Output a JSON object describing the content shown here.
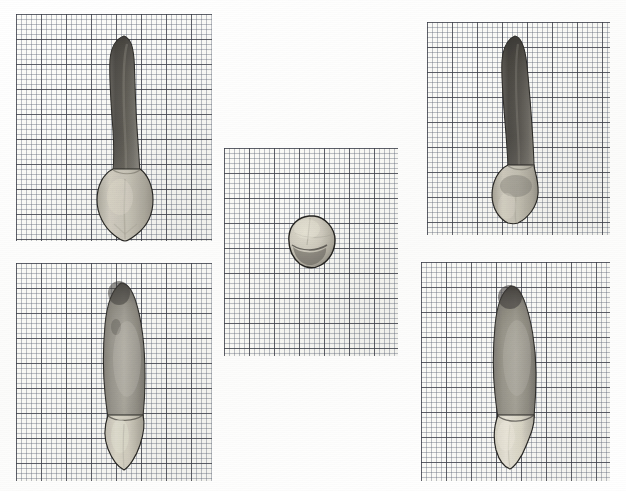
{
  "plate": {
    "title": "Tooth specimen photographic plate",
    "description": "Five photographic views of an extracted human maxillary canine tooth, each placed on millimetre graph paper",
    "background_color": "#ffffff",
    "width": 626,
    "height": 491
  },
  "grid": {
    "paper_color": "#fdfdfb",
    "fine_line_color": "#60687a",
    "bold_line_color": "#3c3e48",
    "fine_spacing_px": 5,
    "bold_spacing_px": 25,
    "units": "mm"
  },
  "palette": {
    "root_dark": "#4c4a46",
    "root_mid": "#6f6c66",
    "root_light": "#8d8a83",
    "crown_enamel": "#cdc9bd",
    "crown_highlight": "#e2ded2",
    "crown_shadow": "#a9a59a",
    "outline": "#2b2a27",
    "cej_line": "#55524c"
  },
  "panels": [
    {
      "id": "panel-top-left",
      "view_label": "labial",
      "position": {
        "x": 16,
        "y": 14,
        "width": 196,
        "height": 227
      },
      "specimen": {
        "id": "specimen-top-left",
        "name": "maxillary-canine-labial-view",
        "orientation": "root-up",
        "root_shade": "dark",
        "crown_shade": "light",
        "box": {
          "x": 78,
          "y": 20,
          "width": 64,
          "height": 208
        }
      }
    },
    {
      "id": "panel-bottom-left",
      "view_label": "mesial",
      "position": {
        "x": 16,
        "y": 263,
        "width": 196,
        "height": 218
      },
      "specimen": {
        "id": "specimen-bottom-left",
        "name": "maxillary-canine-mesial-view",
        "orientation": "root-up",
        "root_shade": "medium",
        "crown_shade": "light",
        "box": {
          "x": 78,
          "y": 18,
          "width": 66,
          "height": 190
        }
      }
    },
    {
      "id": "panel-center",
      "view_label": "incisal",
      "position": {
        "x": 224,
        "y": 148,
        "width": 174,
        "height": 208
      },
      "specimen": {
        "id": "specimen-center",
        "name": "maxillary-canine-incisal-view",
        "orientation": "occlusal",
        "root_shade": "none",
        "crown_shade": "light",
        "box": {
          "x": 62,
          "y": 66,
          "width": 52,
          "height": 56
        }
      }
    },
    {
      "id": "panel-top-right",
      "view_label": "palatal",
      "position": {
        "x": 427,
        "y": 22,
        "width": 183,
        "height": 213
      },
      "specimen": {
        "id": "specimen-top-right",
        "name": "maxillary-canine-palatal-view",
        "orientation": "root-up",
        "root_shade": "dark",
        "crown_shade": "light",
        "box": {
          "x": 62,
          "y": 12,
          "width": 62,
          "height": 190
        }
      }
    },
    {
      "id": "panel-bottom-right",
      "view_label": "distal",
      "position": {
        "x": 421,
        "y": 262,
        "width": 189,
        "height": 219
      },
      "specimen": {
        "id": "specimen-bottom-right",
        "name": "maxillary-canine-distal-view",
        "orientation": "root-up",
        "root_shade": "medium",
        "crown_shade": "light",
        "box": {
          "x": 62,
          "y": 22,
          "width": 66,
          "height": 186
        }
      }
    }
  ]
}
